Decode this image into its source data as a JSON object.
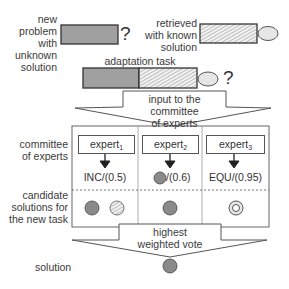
{
  "new_problem": {
    "label_lines": [
      "new",
      "problem",
      "with",
      "unknown",
      "solution"
    ],
    "question_mark": "?"
  },
  "retrieved": {
    "label_lines": [
      "retrieved",
      "with known",
      "solution"
    ]
  },
  "adaptation_task": {
    "label": "adaptation task",
    "question_mark": "?"
  },
  "input_arrow": {
    "label_lines": [
      "input to the committee",
      "of experts"
    ]
  },
  "committee": {
    "row_label_lines": [
      "committee",
      "of experts"
    ],
    "candidates_label_lines": [
      "candidate",
      "solutions for",
      "the new task"
    ],
    "experts": [
      {
        "name": "expert",
        "sub": "1",
        "output_text": "INC/(0.5)",
        "candidates": [
          "dark-circle",
          "hatched-circle"
        ]
      },
      {
        "name": "expert",
        "sub": "2",
        "output_text": "/(0.6)",
        "output_icon": "dark-circle",
        "candidates": [
          "dark-circle"
        ]
      },
      {
        "name": "expert",
        "sub": "3",
        "output_text": "EQU/(0.95)",
        "candidates": [
          "ring-circle"
        ]
      }
    ]
  },
  "vote_arrow": {
    "label_lines": [
      "highest",
      "weighted vote"
    ]
  },
  "solution": {
    "label": "solution"
  },
  "colors": {
    "fill_gray": "#9a9a9a",
    "circle_gray": "#8a8a8a",
    "stroke": "#333333",
    "ellipse_fill": "#e6e6e6"
  }
}
